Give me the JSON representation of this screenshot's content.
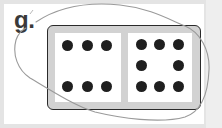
{
  "problem": {
    "label": "g.",
    "domino": {
      "left_pips": 6,
      "right_pips": 8
    }
  },
  "colors": {
    "pip": "#1f1f1f",
    "domino_border": "#2a2a2a",
    "domino_frame": "#d2d2d2",
    "pencil_loop": "#9a9a9a"
  }
}
